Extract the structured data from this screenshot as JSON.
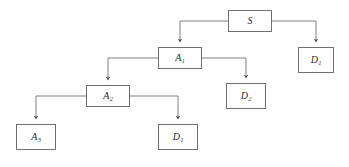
{
  "diagram": {
    "type": "tree",
    "canvas": {
      "width": 349,
      "height": 167
    },
    "style": {
      "background": "#ffffff",
      "node_border_color": "#6f6f6f",
      "node_fill": "#ffffff",
      "edge_color": "#6f6f6f",
      "label_color": "#2b2b2b"
    },
    "nodes": [
      {
        "id": "S",
        "base": "S",
        "sub": "",
        "x": 228,
        "y": 10,
        "w": 44,
        "h": 22,
        "level": 0
      },
      {
        "id": "A1",
        "base": "A",
        "sub": "1",
        "x": 158,
        "y": 47,
        "w": 44,
        "h": 22,
        "level": 1
      },
      {
        "id": "D1r",
        "base": "D",
        "sub": "1",
        "x": 298,
        "y": 47,
        "w": 36,
        "h": 26,
        "level": 1
      },
      {
        "id": "A2",
        "base": "A",
        "sub": "2",
        "x": 86,
        "y": 85,
        "w": 44,
        "h": 22,
        "level": 2
      },
      {
        "id": "D2",
        "base": "D",
        "sub": "2",
        "x": 226,
        "y": 83,
        "w": 40,
        "h": 26,
        "level": 2
      },
      {
        "id": "A3",
        "base": "A",
        "sub": "3",
        "x": 16,
        "y": 124,
        "w": 40,
        "h": 26,
        "level": 3
      },
      {
        "id": "D1b",
        "base": "D",
        "sub": "1",
        "x": 158,
        "y": 124,
        "w": 40,
        "h": 26,
        "level": 3
      }
    ],
    "edges": [
      {
        "from": "S",
        "to": "A1",
        "name": "edge-s-to-a1"
      },
      {
        "from": "S",
        "to": "D1r",
        "name": "edge-s-to-d1-right"
      },
      {
        "from": "A1",
        "to": "A2",
        "name": "edge-a1-to-a2"
      },
      {
        "from": "A1",
        "to": "D2",
        "name": "edge-a1-to-d2"
      },
      {
        "from": "A2",
        "to": "A3",
        "name": "edge-a2-to-a3"
      },
      {
        "from": "A2",
        "to": "D1b",
        "name": "edge-a2-to-d1-bottom"
      }
    ]
  }
}
